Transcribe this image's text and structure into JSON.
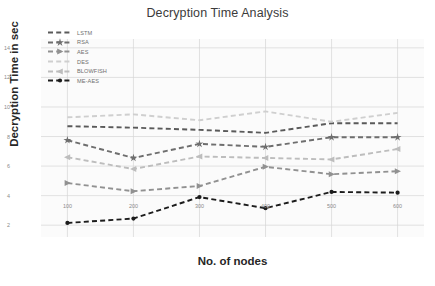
{
  "chart_data": {
    "type": "line",
    "title": "Decryption Time Analysis",
    "xlabel": "No. of nodes",
    "ylabel": "Decryption  Time in sec",
    "categories": [
      "100",
      "200",
      "300",
      "400",
      "500",
      "600"
    ],
    "x": [
      100,
      200,
      300,
      400,
      500,
      600
    ],
    "xlim": [
      60,
      640
    ],
    "ylim": [
      1.2,
      14.6
    ],
    "yticks": [
      "2",
      "4",
      "6",
      "8",
      "10",
      "12",
      "14"
    ],
    "ytick_values": [
      2,
      4,
      6,
      8,
      10,
      12,
      14
    ],
    "xticks": [
      "100",
      "200",
      "300",
      "400",
      "500",
      "600"
    ],
    "grid": true,
    "legend_position": "upper left",
    "series": [
      {
        "name": "LSTM",
        "values": [
          8.7,
          8.6,
          8.45,
          8.25,
          8.9,
          8.9
        ],
        "color": "#5a5a5a",
        "marker": "none",
        "linestyle": "dashed"
      },
      {
        "name": "RSA",
        "values": [
          7.75,
          6.55,
          7.5,
          7.3,
          7.95,
          7.95
        ],
        "color": "#6e6e6e",
        "marker": "star",
        "linestyle": "dashed"
      },
      {
        "name": "AES",
        "values": [
          4.85,
          4.3,
          4.65,
          5.95,
          5.45,
          5.65
        ],
        "color": "#919191",
        "marker": "triangle-right",
        "linestyle": "dashed"
      },
      {
        "name": "DES",
        "values": [
          9.3,
          9.5,
          9.1,
          9.7,
          9.0,
          9.6
        ],
        "color": "#cfcfcf",
        "marker": "none",
        "linestyle": "dashed"
      },
      {
        "name": "BLOWFISH",
        "values": [
          6.6,
          5.8,
          6.65,
          6.55,
          6.45,
          7.15
        ],
        "color": "#bdbdbd",
        "marker": "triangle-left",
        "linestyle": "dashed"
      },
      {
        "name": "ME-AES",
        "values": [
          2.15,
          2.45,
          3.9,
          3.15,
          4.25,
          4.2
        ],
        "color": "#1c1c1c",
        "marker": "circle",
        "linestyle": "dashed"
      }
    ]
  },
  "caption": {
    "text": ""
  }
}
